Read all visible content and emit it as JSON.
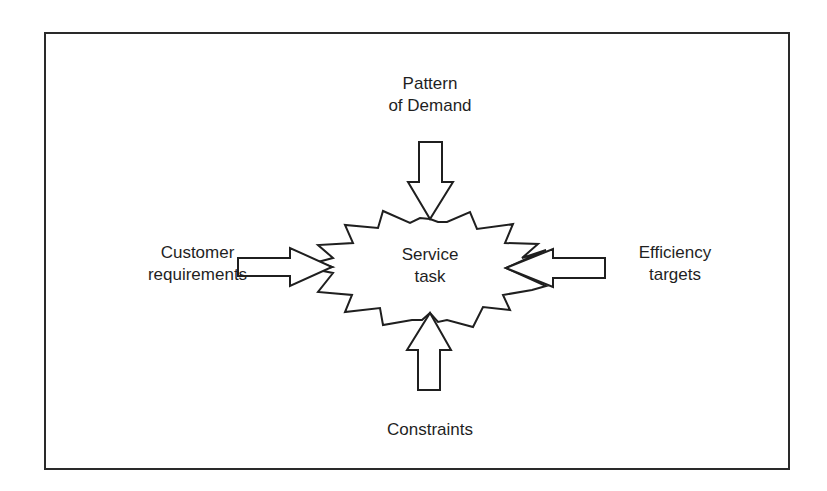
{
  "diagram": {
    "center": {
      "line1": "Service",
      "line2": "task"
    },
    "inputs": {
      "top": {
        "line1": "Pattern",
        "line2": "of Demand",
        "direction": "down"
      },
      "left": {
        "line1": "Customer",
        "line2": "requirements",
        "direction": "right"
      },
      "right": {
        "line1": "Efficiency",
        "line2": "targets",
        "direction": "left"
      },
      "bottom": {
        "line1": "Constraints",
        "direction": "up"
      }
    },
    "colors": {
      "stroke": "#1f1f1f",
      "fill": "#ffffff",
      "frame": "#2a2a2a"
    }
  }
}
